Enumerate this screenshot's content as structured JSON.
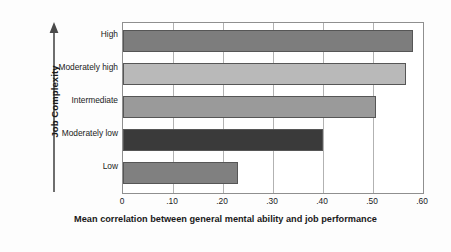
{
  "chart_data": {
    "type": "bar",
    "orientation": "horizontal",
    "title": "",
    "xlabel": "Mean correlation between general mental ability and job performance",
    "ylabel": "Job Complexity",
    "categories": [
      "Low",
      "Moderately low",
      "Intermediate",
      "Moderately high",
      "High"
    ],
    "values": [
      0.23,
      0.4,
      0.505,
      0.566,
      0.58
    ],
    "xlim": [
      0,
      0.6
    ],
    "xticks": [
      0,
      0.1,
      0.2,
      0.3,
      0.4,
      0.5,
      0.6
    ],
    "xtick_labels": [
      "0",
      ".10",
      ".20",
      ".30",
      ".40",
      ".50",
      ".60"
    ],
    "grid": "vertical",
    "legend": "none",
    "bar_colors": [
      "#808080",
      "#3a3a3a",
      "#9a9a9a",
      "#b9b9b9",
      "#7d7d7d"
    ],
    "bar_border_color": "#565656",
    "axis_color": "#8f8f8f",
    "gridline_color": "#b2b2b2",
    "text_color": "#1a1a1a",
    "background_color": "#fdfdfd",
    "y_axis_arrow_direction": "up"
  },
  "bars": [
    {
      "label": "High",
      "value": 0.58,
      "color": "#7d7d7d"
    },
    {
      "label": "Moderately high",
      "value": 0.566,
      "color": "#b9b9b9"
    },
    {
      "label": "Intermediate",
      "value": 0.505,
      "color": "#9a9a9a"
    },
    {
      "label": "Moderately low",
      "value": 0.4,
      "color": "#3a3a3a"
    },
    {
      "label": "Low",
      "value": 0.23,
      "color": "#808080"
    }
  ],
  "axes": {
    "y_title": "Job Complexity",
    "x_title": "Mean correlation between general mental ability and job performance",
    "x_tick_labels": [
      "0",
      ".10",
      ".20",
      ".30",
      ".40",
      ".50",
      ".60"
    ]
  }
}
